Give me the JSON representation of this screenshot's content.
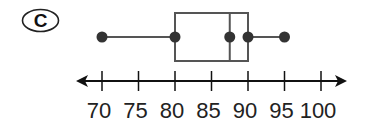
{
  "option_label": "C",
  "chart_data": {
    "type": "boxplot",
    "title": "",
    "xlabel": "",
    "ylabel": "",
    "orientation": "horizontal",
    "xlim": [
      70,
      100
    ],
    "tick_values": [
      70,
      75,
      80,
      85,
      90,
      95,
      100
    ],
    "tick_labels": [
      "70",
      "75",
      "80",
      "85",
      "90",
      "95",
      "100"
    ],
    "five_number_summary": {
      "min": 70,
      "q1": 80,
      "median": 87.5,
      "q3": 90,
      "max": 95
    },
    "axis_arrows": "both",
    "grid": false
  },
  "colors": {
    "box_stroke": "#555555",
    "whisker_stroke": "#555555",
    "point_fill": "#333333",
    "axis_stroke": "#111111",
    "label_color": "#222222"
  }
}
